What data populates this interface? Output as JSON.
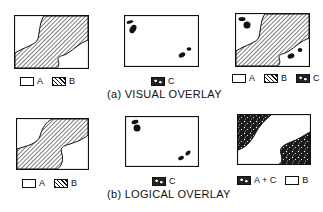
{
  "figure": {
    "row_a": {
      "caption": "(a)  VISUAL OVERLAY",
      "map_ab": {
        "legend": [
          {
            "key": "A",
            "pattern": "blank"
          },
          {
            "key": "B",
            "pattern": "hatched"
          }
        ]
      },
      "map_c": {
        "legend": [
          {
            "key": "C",
            "pattern": "speckled"
          }
        ]
      },
      "map_result": {
        "legend": [
          {
            "key": "A",
            "pattern": "blank"
          },
          {
            "key": "B",
            "pattern": "hatched"
          },
          {
            "key": "C",
            "pattern": "speckled"
          }
        ]
      }
    },
    "row_b": {
      "caption": "(b)  LOGICAL OVERLAY",
      "map_ab": {
        "legend": [
          {
            "key": "A",
            "pattern": "blank"
          },
          {
            "key": "B",
            "pattern": "hatched"
          }
        ]
      },
      "map_c": {
        "legend": [
          {
            "key": "C",
            "pattern": "speckled"
          }
        ]
      },
      "map_result": {
        "legend": [
          {
            "key": "A + C",
            "pattern": "speckled"
          },
          {
            "key": "B",
            "pattern": "blank"
          }
        ]
      }
    },
    "colors": {
      "ink": "#111111",
      "paper": "#ffffff"
    }
  }
}
